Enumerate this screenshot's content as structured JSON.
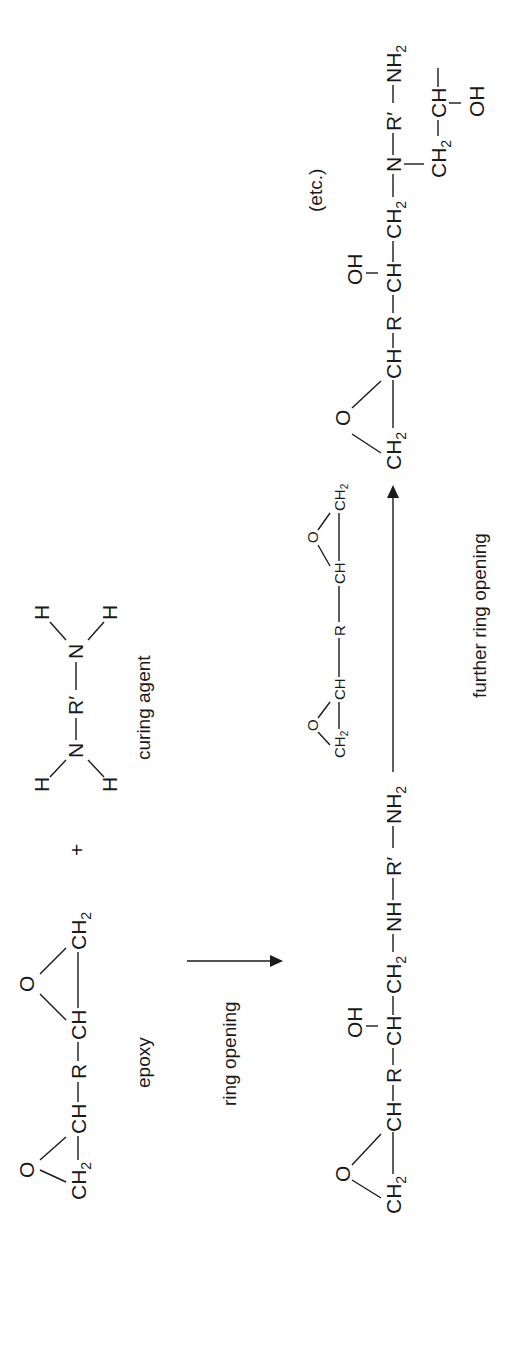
{
  "reactants": {
    "epoxy": {
      "groups": [
        "CH2",
        "O",
        "CH",
        "R",
        "CH",
        "O",
        "CH2"
      ],
      "label": "epoxy"
    },
    "plus": "+",
    "curing_agent": {
      "groups": [
        "H",
        "H",
        "N",
        "R′",
        "N",
        "H",
        "H"
      ],
      "label": "curing agent"
    }
  },
  "step1": {
    "arrow_label": "ring opening"
  },
  "product1": {
    "chain": [
      "CH2",
      "O",
      "CH",
      "R",
      "CH",
      "OH",
      "CH2",
      "NH",
      "R′",
      "NH2"
    ]
  },
  "step2": {
    "reagent": [
      "CH2",
      "O",
      "CH",
      "R",
      "CH",
      "O",
      "CH2"
    ],
    "arrow_label": "further ring opening"
  },
  "product2": {
    "chain": [
      "CH2",
      "O",
      "CH",
      "R",
      "CH",
      "OH",
      "CH2",
      "N",
      "R′",
      "NH2"
    ],
    "branch": [
      "CH2",
      "CH",
      "OH"
    ],
    "etc_label": "(etc.)"
  },
  "text": {
    "CH": "CH",
    "CH2_main": "CH",
    "sub2": "2",
    "O": "O",
    "R": "R",
    "Rp": "R′",
    "N": "N",
    "NH": "NH",
    "NH2_main": "NH",
    "H": "H",
    "OH": "OH",
    "plus": "+"
  }
}
